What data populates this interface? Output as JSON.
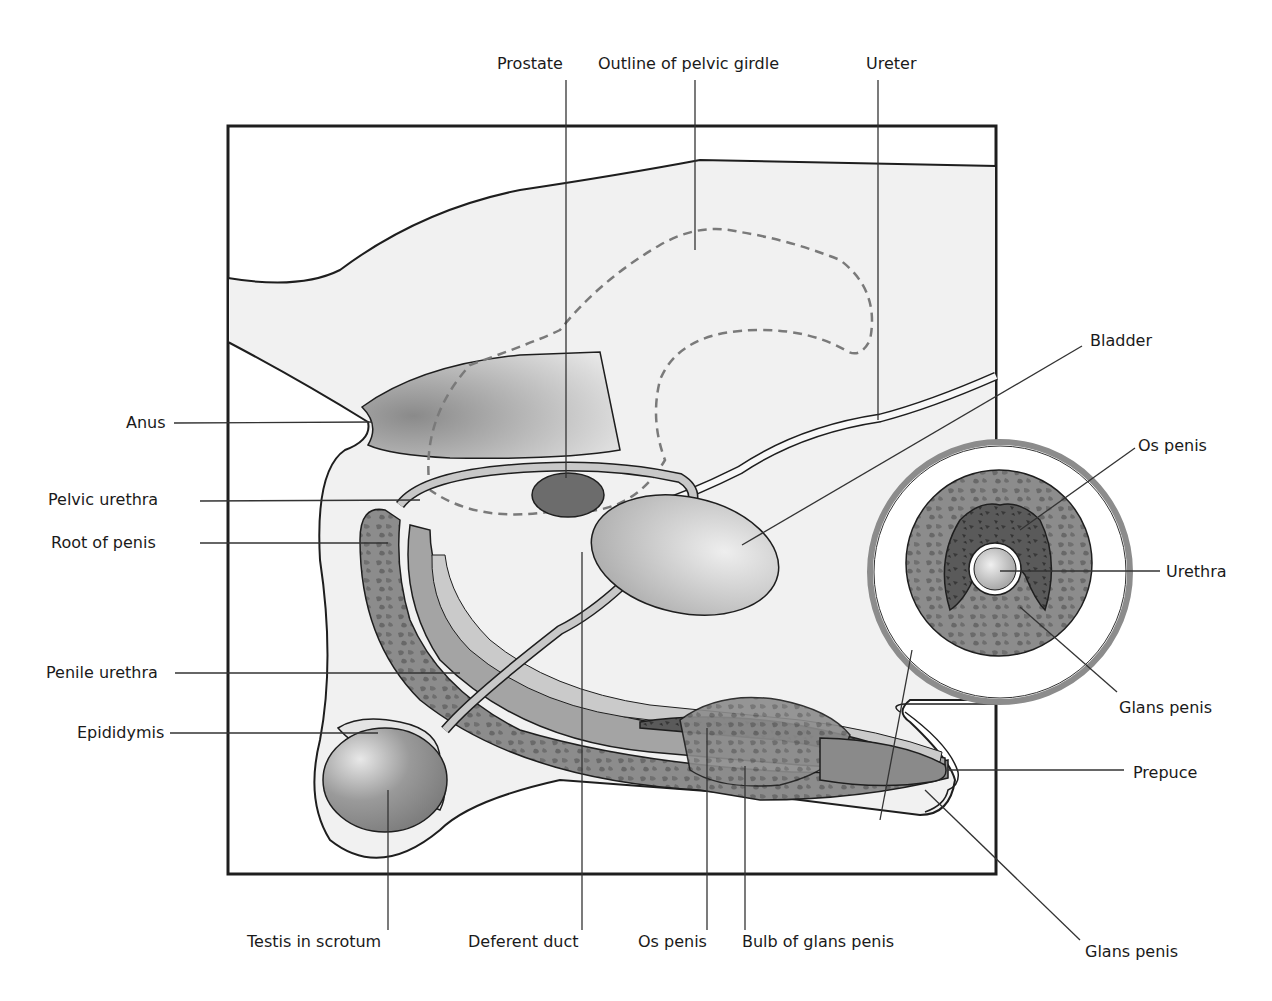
{
  "labels": {
    "top": [
      {
        "id": "prostate",
        "text": "Prostate"
      },
      {
        "id": "pelvic-girdle",
        "text": "Outline of pelvic girdle"
      },
      {
        "id": "ureter",
        "text": "Ureter"
      }
    ],
    "left": [
      {
        "id": "anus",
        "text": "Anus"
      },
      {
        "id": "pelvic-urethra",
        "text": "Pelvic urethra"
      },
      {
        "id": "root-of-penis",
        "text": "Root of penis"
      },
      {
        "id": "penile-urethra",
        "text": "Penile urethra"
      },
      {
        "id": "epididymis",
        "text": "Epididymis"
      }
    ],
    "right": [
      {
        "id": "bladder",
        "text": "Bladder"
      },
      {
        "id": "os-penis-section",
        "text": "Os penis"
      },
      {
        "id": "urethra-section",
        "text": "Urethra"
      },
      {
        "id": "glans-penis-section",
        "text": "Glans penis"
      },
      {
        "id": "prepuce",
        "text": "Prepuce"
      },
      {
        "id": "glans-penis",
        "text": "Glans penis"
      }
    ],
    "bottom": [
      {
        "id": "testis",
        "text": "Testis in scrotum"
      },
      {
        "id": "deferent-duct",
        "text": "Deferent duct"
      },
      {
        "id": "os-penis",
        "text": "Os penis"
      },
      {
        "id": "bulb-glans",
        "text": "Bulb of glans penis"
      }
    ]
  },
  "colors": {
    "outline": "#1e1e1e",
    "body_fill": "#f1f1f1",
    "tissue_dark": "#6f6f6f",
    "tissue_mid": "#9a9a9a",
    "tissue_light": "#c4c4c4",
    "bone_dark": "#4a4a4a",
    "leader": "#333333",
    "dashed": "#7a7a7a"
  }
}
